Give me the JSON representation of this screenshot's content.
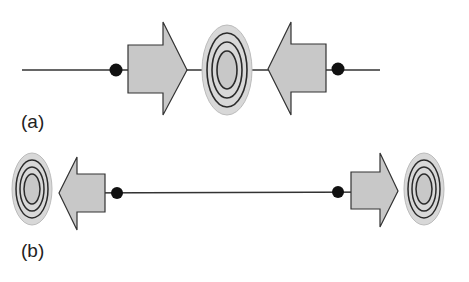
{
  "panels": [
    {
      "id": "a",
      "label": "(a)"
    },
    {
      "id": "b",
      "label": "(b)"
    }
  ],
  "colors": {
    "arrow_fill": "#c8c8c8",
    "ring_outer_fill": "#d8d8d8",
    "ring_stroke": "#2a2a2a",
    "dot": "#111111",
    "line": "#333333"
  }
}
